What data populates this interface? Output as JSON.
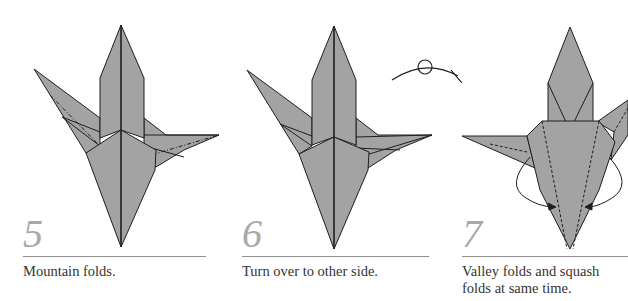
{
  "colors": {
    "paper_fill": "#a3a3a3",
    "line": "#1e1e1e",
    "step_number": "#a9a9a9",
    "rule": "#8f8f8f",
    "caption": "#333333",
    "background": "#ffffff"
  },
  "steps": [
    {
      "number": "5",
      "caption_lines": [
        "Mountain folds."
      ],
      "icon": "crane-base-mountain-folds"
    },
    {
      "number": "6",
      "caption_lines": [
        "Turn over to other side."
      ],
      "icon": "crane-base-turn-over"
    },
    {
      "number": "7",
      "caption_lines": [
        "Valley folds and squash",
        "folds at same time."
      ],
      "icon": "crane-base-valley-squash"
    }
  ],
  "symbols": {
    "turn_over": "turn-over-arrow-icon"
  }
}
